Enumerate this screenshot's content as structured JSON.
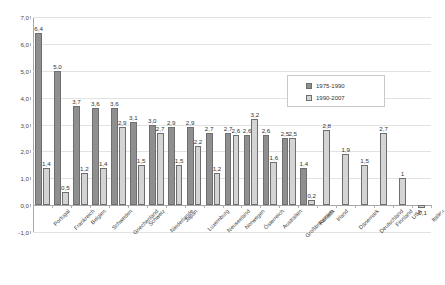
{
  "chart_data": {
    "type": "bar",
    "title": "",
    "xlabel": "",
    "ylabel": "",
    "ylim": [
      -1.0,
      7.0
    ],
    "grid": true,
    "legend_position": "top-right",
    "categories": [
      "Portugal",
      "Frankreich",
      "Belgien",
      "Schweden",
      "Griechenland",
      "Schweiz",
      "Niederlande",
      "Japan",
      "Luxemburg",
      "Neuseeland",
      "Norwegen",
      "Österreich",
      "Australien",
      "Großbritannien",
      "Kanada",
      "Irland",
      "Dänemark",
      "Deutschland",
      "Finnland",
      "USA",
      "Italien"
    ],
    "series": [
      {
        "name": "1975-1990",
        "color": "#8f8f8f",
        "values": [
          6.4,
          5.0,
          3.7,
          3.6,
          3.6,
          3.1,
          3.0,
          2.9,
          2.9,
          2.7,
          2.7,
          2.6,
          2.6,
          2.5,
          1.4,
          null,
          null,
          null,
          null,
          null,
          null
        ],
        "labels": [
          "6,4",
          "5,0",
          "3,7",
          "3,6",
          "3,6",
          "3,1",
          "3,0",
          "2,9",
          "2,9",
          "2,7",
          "2,7",
          "2,6",
          "2,6",
          "2,5",
          "1,4",
          "",
          "",
          "",
          "",
          "",
          ""
        ]
      },
      {
        "name": "1990-2007",
        "color": "#d4d4d4",
        "values": [
          1.4,
          0.5,
          1.2,
          1.4,
          2.9,
          1.5,
          2.7,
          1.5,
          2.2,
          1.2,
          2.6,
          3.2,
          1.6,
          2.5,
          0.2,
          2.8,
          1.9,
          1.5,
          2.7,
          1.0,
          -0.1
        ],
        "labels": [
          "1,4",
          "0,5",
          "1,2",
          "1,4",
          "2,9",
          "1,5",
          "2,7",
          "1,5",
          "2,2",
          "1,2",
          "2,6",
          "3,2",
          "1,6",
          "2,5",
          "0,2",
          "2,8",
          "1,9",
          "1,5",
          "2,7",
          "1",
          "-0,1"
        ]
      }
    ],
    "y_ticks": [
      "7,0",
      "6,0",
      "5,0",
      "4,0",
      "3,0",
      "2,0",
      "1,0",
      "0,0",
      "-1,0"
    ],
    "y_tick_values": [
      7.0,
      6.0,
      5.0,
      4.0,
      3.0,
      2.0,
      1.0,
      0.0,
      -1.0
    ],
    "legend": [
      "1975-1990",
      "1990-2007"
    ]
  }
}
